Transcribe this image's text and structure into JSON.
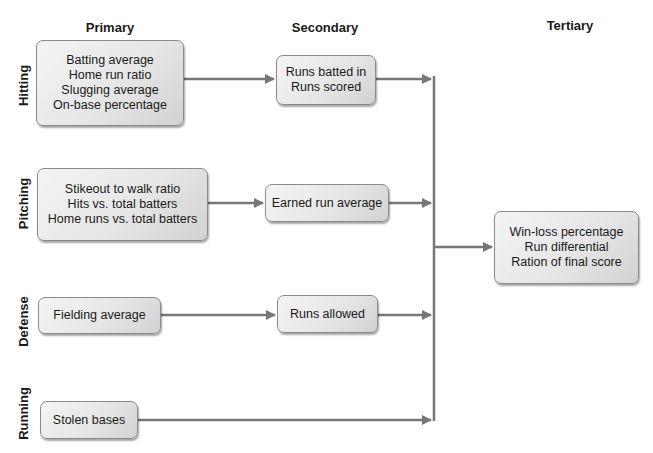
{
  "columns": {
    "primary": "Primary",
    "secondary": "Secondary",
    "tertiary": "Tertiary"
  },
  "rows": {
    "hitting": "Hitting",
    "pitching": "Pitching",
    "defense": "Defense",
    "running": "Running"
  },
  "boxes": {
    "hitting_primary": [
      "Batting average",
      "Home run ratio",
      "Slugging average",
      "On-base percentage"
    ],
    "hitting_secondary": [
      "Runs batted in",
      "Runs scored"
    ],
    "pitching_primary": [
      "Stikeout to walk ratio",
      "Hits vs. total batters",
      "Home runs vs. total batters"
    ],
    "pitching_secondary": [
      "Earned run average"
    ],
    "defense_primary": [
      "Fielding average"
    ],
    "defense_secondary": [
      "Runs allowed"
    ],
    "running_primary": [
      "Stolen bases"
    ],
    "tertiary": [
      "Win-loss percentage",
      "Run differential",
      "Ration of final score"
    ]
  },
  "colors": {
    "arrow": "#777777",
    "box_border": "#8a8a8a",
    "text": "#1a1a1a"
  }
}
